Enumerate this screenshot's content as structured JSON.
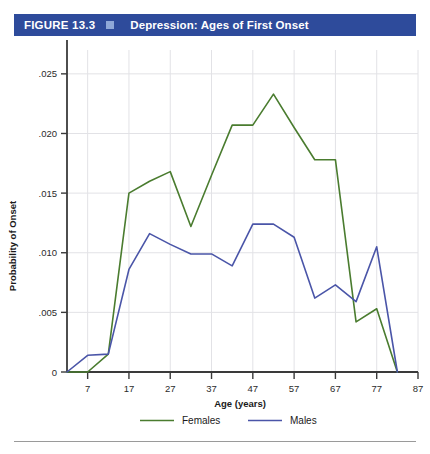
{
  "header": {
    "figure_number": "FIGURE 13.3",
    "title": "Depression: Ages of First Onset",
    "bar_color": "#2e4b9b",
    "marker_color": "#8fa8d8",
    "marker_icon": "square-marker-icon"
  },
  "chart_data": {
    "type": "line",
    "title": "Depression: Ages of First Onset",
    "xlabel": "Age (years)",
    "ylabel": "Probability of Onset",
    "xlim": [
      2,
      87
    ],
    "ylim": [
      0,
      0.027
    ],
    "xticks": [
      7,
      17,
      27,
      37,
      47,
      57,
      67,
      77,
      87
    ],
    "xtick_labels": [
      "7",
      "17",
      "27",
      "37",
      "47",
      "57",
      "67",
      "77",
      "87"
    ],
    "yticks": [
      0,
      0.005,
      0.01,
      0.015,
      0.02,
      0.025
    ],
    "ytick_labels": [
      "0",
      ".005",
      ".010",
      ".015",
      ".020",
      ".025"
    ],
    "grid": true,
    "legend_position": "bottom",
    "x": [
      2,
      7,
      12,
      17,
      22,
      27,
      32,
      37,
      42,
      47,
      52,
      57,
      62,
      67,
      72,
      77,
      82
    ],
    "series": [
      {
        "name": "Females",
        "color": "#4a7c2f",
        "values": [
          0.0,
          0.0,
          0.0015,
          0.015,
          0.016,
          0.0168,
          0.0122,
          0.0165,
          0.0207,
          0.0207,
          0.0233,
          0.0205,
          0.0178,
          0.0178,
          0.0042,
          0.0053,
          0.0
        ]
      },
      {
        "name": "Males",
        "color": "#4a55a8",
        "values": [
          0.0,
          0.0014,
          0.0015,
          0.0086,
          0.0116,
          0.0107,
          0.0099,
          0.0099,
          0.0089,
          0.0124,
          0.0124,
          0.0113,
          0.0062,
          0.0073,
          0.0059,
          0.0105,
          0.0
        ]
      }
    ]
  },
  "legend": [
    {
      "label": "Females",
      "color": "#4a7c2f"
    },
    {
      "label": "Males",
      "color": "#4a55a8"
    }
  ],
  "axis_tick_labels": {
    "y": [
      "0",
      ".005",
      ".010",
      ".015",
      ".020",
      ".025"
    ],
    "x": [
      "7",
      "17",
      "27",
      "37",
      "47",
      "57",
      "67",
      "77",
      "87"
    ]
  }
}
